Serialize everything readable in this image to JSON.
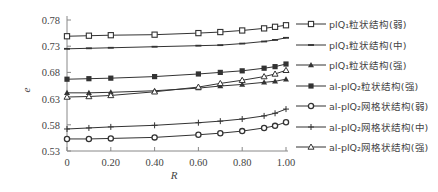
{
  "chart_data": {
    "type": "line",
    "title": "",
    "xlabel": "R",
    "ylabel": "e",
    "xlim": [
      0,
      1.0
    ],
    "ylim": [
      0.53,
      0.78
    ],
    "xticks": [
      "0",
      "0.20",
      "0.40",
      "0.60",
      "0.80",
      "1.00"
    ],
    "yticks": [
      "0.78",
      "0.73",
      "0.68",
      "0.63",
      "0.58",
      "0.53"
    ],
    "grid": false,
    "legend_position": "right",
    "x": [
      0,
      0.1,
      0.2,
      0.4,
      0.6,
      0.7,
      0.8,
      0.9,
      0.95,
      1.0
    ],
    "series": [
      {
        "name": "plQ₁粒状结构(弱)",
        "marker": "open-square",
        "values": [
          0.749,
          0.75,
          0.751,
          0.752,
          0.755,
          0.757,
          0.76,
          0.764,
          0.767,
          0.77
        ]
      },
      {
        "name": "plQ₁粒状结构(中)",
        "marker": "dash",
        "values": [
          0.725,
          0.726,
          0.727,
          0.729,
          0.731,
          0.732,
          0.735,
          0.739,
          0.742,
          0.746
        ]
      },
      {
        "name": "plQ₁粒状结构(强)",
        "marker": "filled-triangle",
        "values": [
          0.641,
          0.641,
          0.642,
          0.645,
          0.65,
          0.654,
          0.657,
          0.661,
          0.663,
          0.667
        ]
      },
      {
        "name": "al-plQ₂粒状结构(强)",
        "marker": "filled-square",
        "values": [
          0.667,
          0.668,
          0.669,
          0.672,
          0.677,
          0.68,
          0.683,
          0.688,
          0.691,
          0.696
        ]
      },
      {
        "name": "al-plQ₂网格状结构(弱)",
        "marker": "open-circle",
        "values": [
          0.553,
          0.553,
          0.554,
          0.556,
          0.561,
          0.564,
          0.568,
          0.574,
          0.578,
          0.585
        ]
      },
      {
        "name": "al-plQ₂网格状结构(中)",
        "marker": "plus",
        "values": [
          0.572,
          0.574,
          0.576,
          0.579,
          0.584,
          0.587,
          0.591,
          0.597,
          0.602,
          0.61
        ]
      },
      {
        "name": "al-plQ₂网格状结构(强)",
        "marker": "open-triangle",
        "values": [
          0.633,
          0.634,
          0.636,
          0.643,
          0.652,
          0.659,
          0.665,
          0.672,
          0.677,
          0.684
        ]
      }
    ]
  },
  "legend": {
    "items": [
      {
        "label": "plQ₁粒状结构(弱)",
        "marker": "open-square"
      },
      {
        "label": "plQ₁粒状结构(中)",
        "marker": "dash"
      },
      {
        "label": "plQ₁粒状结构(强)",
        "marker": "filled-triangle"
      },
      {
        "label": "al-plQ₂粒状结构(强)",
        "marker": "filled-square"
      },
      {
        "label": "al-plQ₂网格状结构(弱)",
        "marker": "open-circle"
      },
      {
        "label": "al-plQ₂网格状结构(中)",
        "marker": "plus"
      },
      {
        "label": "al-plQ₂网格状结构(强)",
        "marker": "open-triangle"
      }
    ]
  },
  "colors": {
    "line": "#333333",
    "axis": "#888888",
    "text": "#444444"
  }
}
